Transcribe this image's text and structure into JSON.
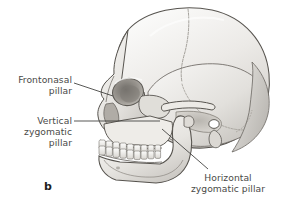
{
  "figure": {
    "letter": "b",
    "background_color": "#ffffff",
    "label_color": "#4a4a48",
    "leader_line_color": "#3a3a38",
    "bone_light": "#f2f1ef",
    "bone_mid": "#d8d6d2",
    "bone_shade": "#b9b6b1",
    "bone_dark": "#8d8a85",
    "outline": "#57544f"
  },
  "labels": [
    {
      "id": "frontonasal",
      "name": "frontonasal-pillar-label",
      "lines": [
        "Frontonasal",
        "pillar"
      ],
      "line1": "Frontonasal",
      "line2": "pillar",
      "align": "right"
    },
    {
      "id": "vertical-zygomatic",
      "name": "vertical-zygomatic-pillar-label",
      "lines": [
        "Vertical",
        "zygomatic",
        "pillar"
      ],
      "line1": "Vertical",
      "line2": "zygomatic",
      "line3": "pillar",
      "align": "right"
    },
    {
      "id": "horizontal-zygomatic",
      "name": "horizontal-zygomatic-pillar-label",
      "lines": [
        "Horizontal",
        "zygomatic pillar"
      ],
      "line1": "Horizontal",
      "line2": "zygomatic pillar",
      "align": "center"
    }
  ],
  "illustration": {
    "subject": "lateral view of human skull",
    "view": "left lateral",
    "structures": [
      "cranial vault",
      "frontal bone",
      "parietal bone",
      "coronal suture",
      "squamous suture",
      "occipital bone",
      "orbit",
      "nasal bones",
      "zygomatic arch",
      "maxilla",
      "maxillary teeth",
      "mandible",
      "mandibular teeth",
      "mandibular ramus",
      "mandibular angle",
      "external acoustic meatus",
      "mastoid process"
    ]
  }
}
